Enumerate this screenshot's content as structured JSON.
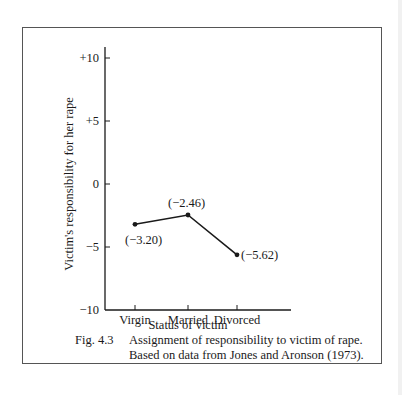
{
  "chart_data": {
    "type": "line",
    "title": "",
    "xlabel": "Status of victim",
    "ylabel": "Victim's responsibility for her rape",
    "categories": [
      "Virgin",
      "Married",
      "Divorced"
    ],
    "series": [
      {
        "name": "Responsibility",
        "values": [
          -3.2,
          -2.46,
          -5.62
        ]
      }
    ],
    "data_labels": [
      "(−3.20)",
      "(−2.46)",
      "(−5.62)"
    ],
    "ylim": [
      -10,
      10
    ],
    "yticks": [
      10,
      5,
      0,
      -5,
      -10
    ],
    "ytick_labels": [
      "+10",
      "+5",
      "0",
      "−5",
      "−10"
    ],
    "grid": false,
    "legend": "none"
  },
  "caption": {
    "figure_number": "Fig. 4.3",
    "line1": "Assignment of responsibility to victim of rape.",
    "line2": "Based on data from Jones and Aronson (1973)."
  },
  "colors": {
    "ink": "#1a1a1a",
    "frame": "#555555"
  }
}
